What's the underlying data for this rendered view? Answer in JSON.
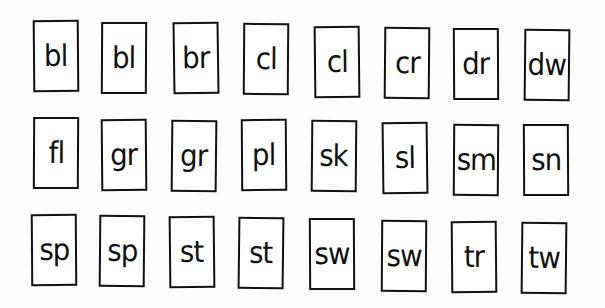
{
  "worksheet": {
    "title": "",
    "rows": [
      {
        "cards": [
          {
            "text": "bl",
            "x": 33,
            "y": 20,
            "r": -0.5
          },
          {
            "text": "bl",
            "x": 101,
            "y": 22,
            "r": 0.3
          },
          {
            "text": "br",
            "x": 173,
            "y": 22,
            "r": -0.8
          },
          {
            "text": "cl",
            "x": 243,
            "y": 23,
            "r": 0.4
          },
          {
            "text": "cl",
            "x": 314,
            "y": 26,
            "r": -0.6
          },
          {
            "text": "cr",
            "x": 384,
            "y": 27,
            "r": 0.5
          },
          {
            "text": "dr",
            "x": 453,
            "y": 28,
            "r": -0.3
          },
          {
            "text": "dw",
            "x": 524,
            "y": 29,
            "r": 0.6
          }
        ]
      },
      {
        "cards": [
          {
            "text": "fl",
            "x": 33,
            "y": 117,
            "r": 0.3
          },
          {
            "text": "gr",
            "x": 101,
            "y": 119,
            "r": -0.5
          },
          {
            "text": "gr",
            "x": 171,
            "y": 120,
            "r": 0.6
          },
          {
            "text": "pl",
            "x": 241,
            "y": 119,
            "r": -0.4
          },
          {
            "text": "sk",
            "x": 311,
            "y": 120,
            "r": 0.5
          },
          {
            "text": "sl",
            "x": 382,
            "y": 122,
            "r": -0.7
          },
          {
            "text": "sm",
            "x": 453,
            "y": 124,
            "r": 0.4
          },
          {
            "text": "sn",
            "x": 523,
            "y": 124,
            "r": -0.3
          }
        ]
      },
      {
        "cards": [
          {
            "text": "sp",
            "x": 31,
            "y": 214,
            "r": -0.4
          },
          {
            "text": "sp",
            "x": 99,
            "y": 215,
            "r": 0.5
          },
          {
            "text": "st",
            "x": 169,
            "y": 216,
            "r": -0.6
          },
          {
            "text": "st",
            "x": 238,
            "y": 217,
            "r": 0.7
          },
          {
            "text": "sw",
            "x": 309,
            "y": 218,
            "r": -0.3
          },
          {
            "text": "sw",
            "x": 381,
            "y": 220,
            "r": 0.4
          },
          {
            "text": "tr",
            "x": 451,
            "y": 221,
            "r": -0.5
          },
          {
            "text": "tw",
            "x": 521,
            "y": 222,
            "r": 0.6
          }
        ]
      }
    ]
  },
  "colors": {
    "ink": "#111111",
    "paper": "#ffffff"
  }
}
